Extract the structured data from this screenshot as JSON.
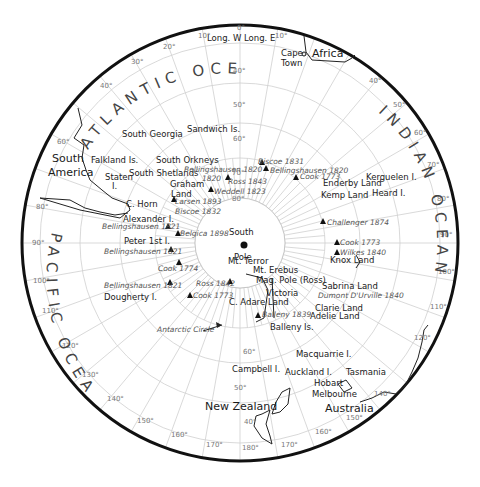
{
  "map": {
    "center": [
      240,
      243
    ],
    "outer_radius": 218,
    "inner_radius": 45,
    "latitude_rings": [
      {
        "label": "80°",
        "r": 45
      },
      {
        "label": "70°",
        "r": 85
      },
      {
        "label": "60°",
        "r": 120
      },
      {
        "label": "50°",
        "r": 160
      },
      {
        "label": "40°",
        "r": 200
      }
    ],
    "longitude_headers": {
      "west": "Long. W",
      "east": "Long. E"
    },
    "oceans": [
      "ATLANTIC OCEAN",
      "INDIAN OCEAN",
      "PACIFIC OCEAN"
    ],
    "continents": [
      "Africa",
      "South America",
      "Australia",
      "New Zealand"
    ],
    "longitude_labels": [
      "0°",
      "10°",
      "20°",
      "30°",
      "40°",
      "50°",
      "60°",
      "70°",
      "80°",
      "90°",
      "100°",
      "110°",
      "120°",
      "130°",
      "140°",
      "150°",
      "160°",
      "170°",
      "180°"
    ],
    "pole": {
      "line1": "South",
      "line2": "Pole"
    },
    "places": [
      {
        "name": "Cape Town",
        "line1": "Cape",
        "line2": "Town"
      },
      {
        "name": "South Georgia"
      },
      {
        "name": "Sandwich Is."
      },
      {
        "name": "Falkland Is."
      },
      {
        "name": "South Orkneys"
      },
      {
        "name": "Staten I."
      },
      {
        "name": "South Shetlands"
      },
      {
        "name": "Graham Land"
      },
      {
        "name": "C. Horn"
      },
      {
        "name": "Alexander I."
      },
      {
        "name": "Peter 1st I."
      },
      {
        "name": "Dougherty I."
      },
      {
        "name": "Enderby Land"
      },
      {
        "name": "Kemp Land"
      },
      {
        "name": "Kerguelen I."
      },
      {
        "name": "Heard I."
      },
      {
        "name": "Knox Land"
      },
      {
        "name": "Mt. Terror"
      },
      {
        "name": "Mt. Erebus"
      },
      {
        "name": "Mag. Pole (Ross)"
      },
      {
        "name": "Victoria Land"
      },
      {
        "name": "C. Adare"
      },
      {
        "name": "Sabrina Land"
      },
      {
        "name": "Clarie Land"
      },
      {
        "name": "Adelie Land"
      },
      {
        "name": "Balleny Is."
      },
      {
        "name": "Macquarrie I."
      },
      {
        "name": "Campbell I."
      },
      {
        "name": "Auckland I."
      },
      {
        "name": "Tasmania"
      },
      {
        "name": "Hobart"
      },
      {
        "name": "Melbourne"
      },
      {
        "name": "Antarctic Circle"
      }
    ],
    "explorers": [
      "Biscoe 1831",
      "Bellingshausen 1820",
      "Cook 1773",
      "Ross 1843",
      "Weddell 1823",
      "Larsen 1893",
      "Biscoe 1832",
      "Bellingshausen 1821",
      "Belgica 1898",
      "Bellingshausen 1821",
      "Cook 1774",
      "Bellingshausen 1821",
      "Ross 1842",
      "Cook 1773",
      "Balleny 1839",
      "Challenger 1874",
      "Cook 1773",
      "Wilkes 1840",
      "Dumont D'Urville 1840",
      "Bellingshausen 1820"
    ]
  }
}
